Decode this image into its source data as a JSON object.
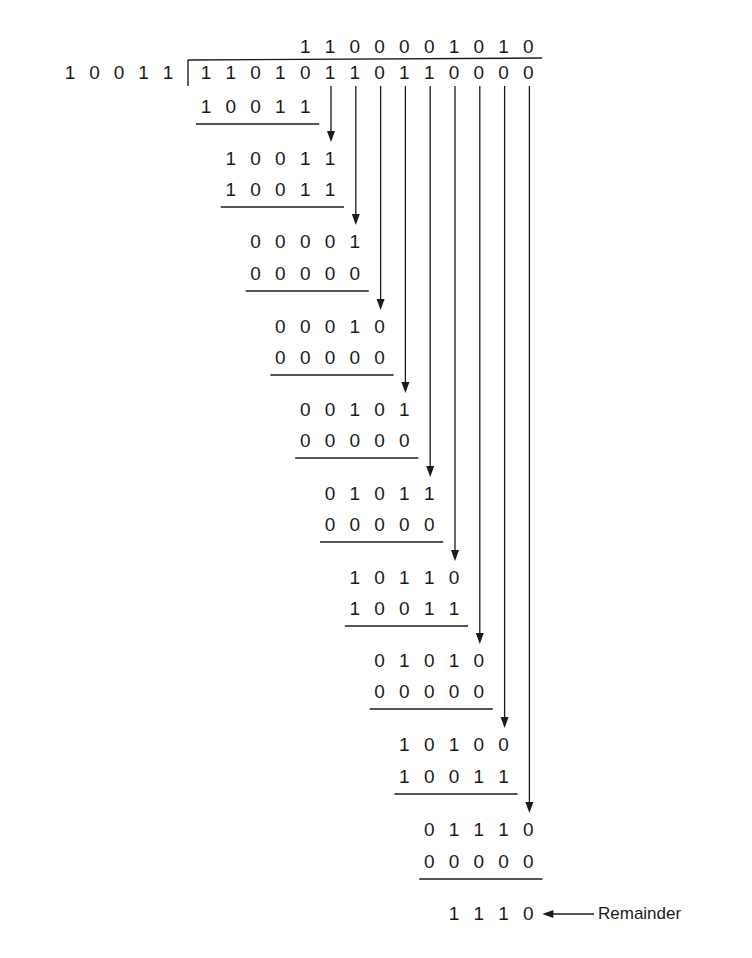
{
  "divisor": "10011",
  "dividend": "11010110110000",
  "quotient": "1100001010",
  "steps": [
    {
      "upper": "11010",
      "lower": "10011"
    },
    {
      "upper": "10011",
      "lower": "10011"
    },
    {
      "upper": "00001",
      "lower": "00000"
    },
    {
      "upper": "00010",
      "lower": "00000"
    },
    {
      "upper": "00101",
      "lower": "00000"
    },
    {
      "upper": "01011",
      "lower": "00000"
    },
    {
      "upper": "10110",
      "lower": "10011"
    },
    {
      "upper": "01010",
      "lower": "00000"
    },
    {
      "upper": "10100",
      "lower": "10011"
    },
    {
      "upper": "01110",
      "lower": "00000"
    }
  ],
  "remainder": "1110",
  "remainder_label": "Remainder",
  "colors": {
    "ink": "#1a1a1a",
    "background": "#ffffff"
  }
}
